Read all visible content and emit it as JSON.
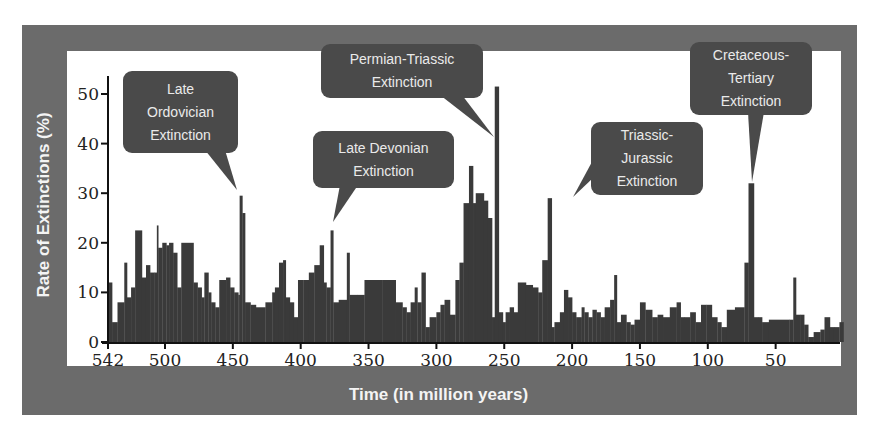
{
  "chart_data": {
    "type": "bar",
    "title": "",
    "xlabel": "Time (in million years)",
    "ylabel": "Rate of Extinctions (%)",
    "xlim": [
      542,
      0
    ],
    "ylim": [
      0,
      55
    ],
    "x_ticks": [
      542,
      500,
      450,
      400,
      350,
      300,
      250,
      200,
      150,
      100,
      50
    ],
    "y_ticks": [
      0,
      10,
      20,
      30,
      40,
      50
    ],
    "grid": false,
    "legend": null,
    "bar_color": "#3a3a3a",
    "bars": [
      {
        "start": 542,
        "end": 539,
        "value": 12
      },
      {
        "start": 539,
        "end": 535,
        "value": 4
      },
      {
        "start": 535,
        "end": 530,
        "value": 8
      },
      {
        "start": 530,
        "end": 528,
        "value": 16
      },
      {
        "start": 528,
        "end": 525,
        "value": 9
      },
      {
        "start": 525,
        "end": 522,
        "value": 11
      },
      {
        "start": 522,
        "end": 517,
        "value": 22.5
      },
      {
        "start": 517,
        "end": 514,
        "value": 13
      },
      {
        "start": 514,
        "end": 511,
        "value": 15.5
      },
      {
        "start": 511,
        "end": 508,
        "value": 14
      },
      {
        "start": 508,
        "end": 506,
        "value": 14
      },
      {
        "start": 506,
        "end": 505,
        "value": 23.5
      },
      {
        "start": 505,
        "end": 502,
        "value": 19
      },
      {
        "start": 502,
        "end": 499,
        "value": 20
      },
      {
        "start": 499,
        "end": 497,
        "value": 19.5
      },
      {
        "start": 497,
        "end": 494,
        "value": 20
      },
      {
        "start": 494,
        "end": 491,
        "value": 18
      },
      {
        "start": 491,
        "end": 488,
        "value": 11
      },
      {
        "start": 488,
        "end": 479,
        "value": 20
      },
      {
        "start": 479,
        "end": 476,
        "value": 12
      },
      {
        "start": 476,
        "end": 473,
        "value": 11
      },
      {
        "start": 473,
        "end": 471,
        "value": 9
      },
      {
        "start": 471,
        "end": 468,
        "value": 14
      },
      {
        "start": 468,
        "end": 466,
        "value": 10
      },
      {
        "start": 466,
        "end": 463,
        "value": 8
      },
      {
        "start": 463,
        "end": 460,
        "value": 7
      },
      {
        "start": 460,
        "end": 455,
        "value": 12.5
      },
      {
        "start": 455,
        "end": 452,
        "value": 13
      },
      {
        "start": 452,
        "end": 449,
        "value": 11
      },
      {
        "start": 449,
        "end": 446,
        "value": 10
      },
      {
        "start": 446,
        "end": 445,
        "value": 9.5
      },
      {
        "start": 445,
        "end": 443,
        "value": 29.5
      },
      {
        "start": 443,
        "end": 441,
        "value": 26
      },
      {
        "start": 441,
        "end": 437,
        "value": 8
      },
      {
        "start": 437,
        "end": 433,
        "value": 7.5
      },
      {
        "start": 433,
        "end": 426,
        "value": 7
      },
      {
        "start": 426,
        "end": 421,
        "value": 8
      },
      {
        "start": 421,
        "end": 419,
        "value": 10
      },
      {
        "start": 419,
        "end": 416,
        "value": 11
      },
      {
        "start": 416,
        "end": 413,
        "value": 16
      },
      {
        "start": 413,
        "end": 411,
        "value": 16.5
      },
      {
        "start": 411,
        "end": 408,
        "value": 9
      },
      {
        "start": 408,
        "end": 405,
        "value": 8
      },
      {
        "start": 405,
        "end": 402,
        "value": 5
      },
      {
        "start": 402,
        "end": 398,
        "value": 12.5
      },
      {
        "start": 398,
        "end": 394,
        "value": 12.5
      },
      {
        "start": 394,
        "end": 390,
        "value": 14
      },
      {
        "start": 390,
        "end": 386,
        "value": 15.5
      },
      {
        "start": 386,
        "end": 383,
        "value": 19.5
      },
      {
        "start": 383,
        "end": 381,
        "value": 12
      },
      {
        "start": 381,
        "end": 378,
        "value": 11
      },
      {
        "start": 378,
        "end": 376,
        "value": 22.5
      },
      {
        "start": 376,
        "end": 372,
        "value": 8
      },
      {
        "start": 372,
        "end": 366,
        "value": 8.5
      },
      {
        "start": 366,
        "end": 364,
        "value": 18
      },
      {
        "start": 364,
        "end": 358,
        "value": 9.5
      },
      {
        "start": 358,
        "end": 353,
        "value": 9.5
      },
      {
        "start": 353,
        "end": 340,
        "value": 12.5
      },
      {
        "start": 340,
        "end": 330,
        "value": 12.5
      },
      {
        "start": 330,
        "end": 325,
        "value": 8
      },
      {
        "start": 325,
        "end": 322,
        "value": 7
      },
      {
        "start": 322,
        "end": 319,
        "value": 6
      },
      {
        "start": 319,
        "end": 316,
        "value": 8
      },
      {
        "start": 316,
        "end": 314,
        "value": 11
      },
      {
        "start": 314,
        "end": 311,
        "value": 8
      },
      {
        "start": 311,
        "end": 308,
        "value": 14
      },
      {
        "start": 308,
        "end": 305,
        "value": 3
      },
      {
        "start": 305,
        "end": 300,
        "value": 5
      },
      {
        "start": 300,
        "end": 297,
        "value": 6
      },
      {
        "start": 297,
        "end": 294,
        "value": 7.5
      },
      {
        "start": 294,
        "end": 290,
        "value": 8.5
      },
      {
        "start": 290,
        "end": 286,
        "value": 5.5
      },
      {
        "start": 286,
        "end": 283,
        "value": 12.5
      },
      {
        "start": 283,
        "end": 280,
        "value": 16
      },
      {
        "start": 280,
        "end": 276,
        "value": 28
      },
      {
        "start": 276,
        "end": 273,
        "value": 35.5
      },
      {
        "start": 273,
        "end": 271,
        "value": 28
      },
      {
        "start": 271,
        "end": 265,
        "value": 30
      },
      {
        "start": 265,
        "end": 262,
        "value": 28.5
      },
      {
        "start": 262,
        "end": 259,
        "value": 25
      },
      {
        "start": 259,
        "end": 257,
        "value": 5
      },
      {
        "start": 257,
        "end": 254,
        "value": 51.5
      },
      {
        "start": 254,
        "end": 251,
        "value": 6
      },
      {
        "start": 251,
        "end": 249,
        "value": 4
      },
      {
        "start": 249,
        "end": 246,
        "value": 6
      },
      {
        "start": 246,
        "end": 243,
        "value": 7
      },
      {
        "start": 243,
        "end": 240,
        "value": 6
      },
      {
        "start": 240,
        "end": 234,
        "value": 12
      },
      {
        "start": 234,
        "end": 229,
        "value": 11.5
      },
      {
        "start": 229,
        "end": 225,
        "value": 11
      },
      {
        "start": 225,
        "end": 222,
        "value": 10
      },
      {
        "start": 222,
        "end": 218,
        "value": 16.5
      },
      {
        "start": 218,
        "end": 215,
        "value": 29
      },
      {
        "start": 215,
        "end": 213,
        "value": 3
      },
      {
        "start": 213,
        "end": 209,
        "value": 4
      },
      {
        "start": 209,
        "end": 206,
        "value": 6
      },
      {
        "start": 206,
        "end": 203,
        "value": 10.5
      },
      {
        "start": 203,
        "end": 200,
        "value": 9
      },
      {
        "start": 200,
        "end": 197,
        "value": 6
      },
      {
        "start": 197,
        "end": 193,
        "value": 5
      },
      {
        "start": 193,
        "end": 191,
        "value": 7
      },
      {
        "start": 191,
        "end": 188,
        "value": 6
      },
      {
        "start": 188,
        "end": 185,
        "value": 5
      },
      {
        "start": 185,
        "end": 182,
        "value": 6.5
      },
      {
        "start": 182,
        "end": 179,
        "value": 6
      },
      {
        "start": 179,
        "end": 176,
        "value": 5
      },
      {
        "start": 176,
        "end": 172,
        "value": 7
      },
      {
        "start": 172,
        "end": 169,
        "value": 8.5
      },
      {
        "start": 169,
        "end": 167,
        "value": 13.5
      },
      {
        "start": 167,
        "end": 164,
        "value": 4
      },
      {
        "start": 164,
        "end": 160,
        "value": 5.5
      },
      {
        "start": 160,
        "end": 157,
        "value": 4
      },
      {
        "start": 157,
        "end": 154,
        "value": 3.5
      },
      {
        "start": 154,
        "end": 150,
        "value": 4.5
      },
      {
        "start": 150,
        "end": 146,
        "value": 8
      },
      {
        "start": 146,
        "end": 141,
        "value": 6.5
      },
      {
        "start": 141,
        "end": 137,
        "value": 5
      },
      {
        "start": 137,
        "end": 133,
        "value": 5.5
      },
      {
        "start": 133,
        "end": 128,
        "value": 5
      },
      {
        "start": 128,
        "end": 123,
        "value": 7
      },
      {
        "start": 123,
        "end": 120,
        "value": 8
      },
      {
        "start": 120,
        "end": 117,
        "value": 5
      },
      {
        "start": 117,
        "end": 113,
        "value": 5
      },
      {
        "start": 113,
        "end": 109,
        "value": 6
      },
      {
        "start": 109,
        "end": 105,
        "value": 4
      },
      {
        "start": 105,
        "end": 101,
        "value": 7.5
      },
      {
        "start": 101,
        "end": 97,
        "value": 7.5
      },
      {
        "start": 97,
        "end": 93,
        "value": 5
      },
      {
        "start": 93,
        "end": 90,
        "value": 4
      },
      {
        "start": 90,
        "end": 86,
        "value": 3
      },
      {
        "start": 86,
        "end": 80,
        "value": 6.5
      },
      {
        "start": 80,
        "end": 73,
        "value": 7
      },
      {
        "start": 73,
        "end": 70,
        "value": 16
      },
      {
        "start": 70,
        "end": 66,
        "value": 32
      },
      {
        "start": 66,
        "end": 63,
        "value": 5
      },
      {
        "start": 63,
        "end": 60,
        "value": 5
      },
      {
        "start": 60,
        "end": 55,
        "value": 4
      },
      {
        "start": 55,
        "end": 40,
        "value": 4.5
      },
      {
        "start": 40,
        "end": 37,
        "value": 4.5
      },
      {
        "start": 37,
        "end": 35,
        "value": 13
      },
      {
        "start": 35,
        "end": 32,
        "value": 5.5
      },
      {
        "start": 32,
        "end": 29,
        "value": 5.5
      },
      {
        "start": 29,
        "end": 26,
        "value": 3.5
      },
      {
        "start": 26,
        "end": 22,
        "value": 1
      },
      {
        "start": 22,
        "end": 17,
        "value": 2
      },
      {
        "start": 17,
        "end": 14,
        "value": 2.5
      },
      {
        "start": 14,
        "end": 10,
        "value": 5
      },
      {
        "start": 10,
        "end": 7,
        "value": 3
      },
      {
        "start": 7,
        "end": 3,
        "value": 3
      },
      {
        "start": 3,
        "end": 0,
        "value": 4
      }
    ],
    "annotations": [
      {
        "label": [
          "Late",
          "Ordovician",
          "Extinction"
        ],
        "x": 444,
        "y": 29.5
      },
      {
        "label": [
          "Late Devonian",
          "Extinction"
        ],
        "x": 377,
        "y": 22.5
      },
      {
        "label": [
          "Permian-Triassic",
          "Extinction"
        ],
        "x": 256,
        "y": 51.5
      },
      {
        "label": [
          "Triassic-",
          "Jurassic",
          "Extinction"
        ],
        "x": 216,
        "y": 29
      },
      {
        "label": [
          "Cretaceous-",
          "Tertiary",
          "Extinction"
        ],
        "x": 67,
        "y": 32
      }
    ]
  },
  "labels": {
    "ylabel": "Rate of Extinctions (%)",
    "xlabel": "Time (in million years)"
  },
  "callouts": {
    "ordovician": [
      "Late",
      "Ordovician",
      "Extinction"
    ],
    "devonian": [
      "Late Devonian",
      "Extinction"
    ],
    "permian": [
      "Permian-Triassic",
      "Extinction"
    ],
    "triassic": [
      "Triassic-",
      "Jurassic",
      "Extinction"
    ],
    "cretaceous": [
      "Cretaceous-",
      "Tertiary",
      "Extinction"
    ]
  },
  "colors": {
    "frame": "#6b6b6b",
    "bar": "#3a3a3a",
    "callout": "#4a4a4a",
    "label_text": "#f4f4f4"
  }
}
